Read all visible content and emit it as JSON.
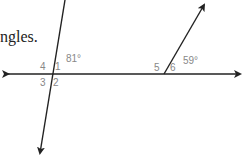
{
  "caption": {
    "text": "ngles."
  },
  "diagram": {
    "line_color": "#222222",
    "label_color": "#888888",
    "labels": {
      "angle1": "1",
      "angle2": "2",
      "angle3": "3",
      "angle4": "4",
      "angle5": "5",
      "angle6": "6",
      "angle1_measure": "81°",
      "angle6_measure": "59°"
    }
  }
}
